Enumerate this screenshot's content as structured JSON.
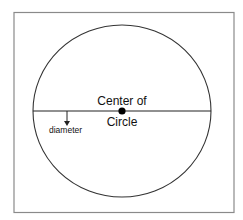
{
  "diagram": {
    "center_label_line1": "Center of",
    "center_label_line2": "Circle",
    "diameter_label": "diameter",
    "colors": {
      "frame": "#8a8a8a",
      "circle": "#333333",
      "line": "#222222",
      "dot": "#000000"
    }
  }
}
